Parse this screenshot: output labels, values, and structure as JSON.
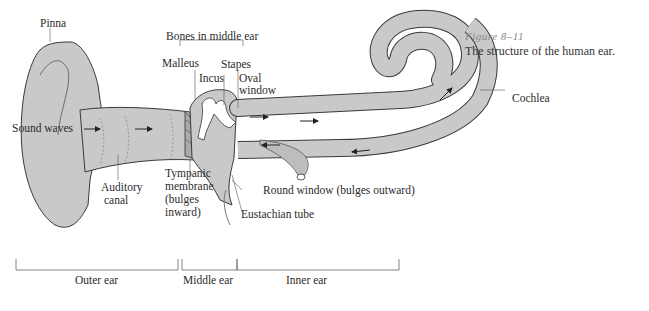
{
  "caption": {
    "figure_number": "Figure 8–11",
    "text": "The structure of the human ear."
  },
  "labels": {
    "pinna": "Pinna",
    "bones_in_middle_ear": "Bones in middle ear",
    "malleus": "Malleus",
    "incus": "Incus",
    "stapes": "Stapes",
    "oval_window_1": "Oval",
    "oval_window_2": "window",
    "cochlea": "Cochlea",
    "sound_waves": "Sound waves",
    "auditory_canal_1": "Auditory",
    "auditory_canal_2": "canal",
    "tympanic_1": "Tympanic",
    "tympanic_2": "membrane",
    "tympanic_3": "(bulges",
    "tympanic_4": "inward)",
    "round_window": "Round window (bulges outward)",
    "eustachian_tube": "Eustachian tube"
  },
  "regions": {
    "outer_ear": "Outer ear",
    "middle_ear": "Middle ear",
    "inner_ear": "Inner ear"
  },
  "colors": {
    "tissue_fill": "#c9c9c9",
    "outline": "#3a3a3a",
    "background": "#ffffff"
  }
}
